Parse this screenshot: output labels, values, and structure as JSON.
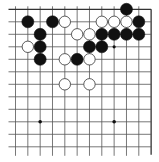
{
  "board": {
    "description": "Cropped Go board diagram (upper-right region, top and right edges visible)",
    "visible_columns": 12,
    "visible_rows": 12,
    "origin_x": 15.5,
    "origin_y": 9.3,
    "spacing_x": 12.33,
    "spacing_y": 12.5,
    "stone_radius": 6,
    "line_color": "#555555",
    "edge_color": "#333333",
    "black_color": "#111111",
    "white_fill": "#ffffff",
    "white_stroke": "#333333",
    "background": "#ffffff"
  },
  "stones": {
    "black": [
      [
        1,
        1
      ],
      [
        3,
        1
      ],
      [
        9,
        0
      ],
      [
        10,
        1
      ],
      [
        2,
        2
      ],
      [
        7,
        2
      ],
      [
        8,
        2
      ],
      [
        9,
        2
      ],
      [
        10,
        2
      ],
      [
        2,
        3
      ],
      [
        6,
        3
      ],
      [
        7,
        3
      ],
      [
        2,
        4
      ],
      [
        5,
        4
      ]
    ],
    "white": [
      [
        4,
        1
      ],
      [
        7,
        1
      ],
      [
        8,
        1
      ],
      [
        9,
        1
      ],
      [
        5,
        2
      ],
      [
        6,
        2
      ],
      [
        1,
        3
      ],
      [
        4,
        4
      ],
      [
        6,
        4
      ],
      [
        4,
        6
      ],
      [
        6,
        6
      ]
    ]
  },
  "markers": {
    "dots": [
      [
        8,
        3
      ]
    ]
  },
  "star_points": [
    [
      2,
      9
    ],
    [
      8,
      9
    ]
  ]
}
